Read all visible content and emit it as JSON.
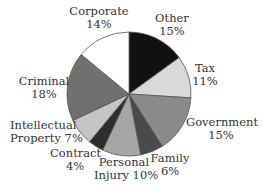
{
  "chart_data": {
    "type": "pie",
    "title": "",
    "categories": [
      "Other",
      "Tax",
      "Government",
      "Family",
      "Personal Injury",
      "Contract",
      "Intellectual Property",
      "Criminal",
      "Corporate"
    ],
    "values": [
      15,
      11,
      15,
      6,
      10,
      4,
      7,
      18,
      14
    ],
    "unit": "%",
    "start_angle": "12 o'clock",
    "direction": "clockwise",
    "colors": [
      "#111111",
      "#d9d9d9",
      "#8a8a8a",
      "#4a4a4a",
      "#a6a6a6",
      "#2e2e2e",
      "#c4c4c4",
      "#707070",
      "#ffffff"
    ],
    "legend": "none (direct labels)"
  },
  "labels": {
    "other": {
      "line1": "Other",
      "line2": "15%"
    },
    "tax": {
      "line1": "Tax",
      "line2": "11%"
    },
    "government": {
      "line1": "Government",
      "line2": "15%"
    },
    "family": {
      "line1": "Family",
      "line2": "6%"
    },
    "personal_injury": {
      "line1": "Personal",
      "line2": "Injury 10%"
    },
    "contract": {
      "line1": "Contract",
      "line2": "4%"
    },
    "intellectual_property": {
      "line1": "Intellectual",
      "line2": "Property 7%"
    },
    "criminal": {
      "line1": "Criminal",
      "line2": "18%"
    },
    "corporate": {
      "line1": "Corporate",
      "line2": "14%"
    }
  }
}
